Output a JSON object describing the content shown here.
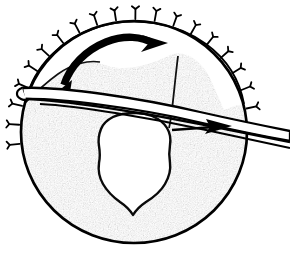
{
  "figure": {
    "description": "Line drawing of a circular cross-section with stippled shading, a central shield-shaped cavity, radiating suture tick marks around the rim, a curved sweeping arrow at the top and a straight arrow at the right, with a long tapered instrument passing diagonally across the section.",
    "background_color": "#ffffff",
    "ink_color": "#000000",
    "stipple_color": "#b2b2b2",
    "stipple_dark": "#8c8c8c",
    "cavity_fill": "#ffffff"
  },
  "geometry": {
    "canvas": {
      "width": 290,
      "height": 257
    },
    "outer_circle": {
      "label": "outer boundary",
      "center_x": 134,
      "center_y": 132,
      "radius_x": 114,
      "radius_y": 112,
      "stroke_width": 2.6
    },
    "inner_arc": {
      "label": "inner concentric rim arc",
      "center_x": 134,
      "center_y": 134,
      "radius_x": 106,
      "radius_y": 104,
      "stroke_width": 1.8
    }
  },
  "elements": {
    "rim_ticks": {
      "name": "radiating suture tick marks",
      "count": 19,
      "angle_start_deg": 186,
      "angle_end_deg": 12,
      "length": 11,
      "barb_length": 5,
      "stroke_width": 1.7,
      "note": "Small Y-shaped barbed marks projecting outward from the upper rim of the circle"
    },
    "shaded_region": {
      "name": "stippled tissue mass",
      "fill": "#b2b2b2",
      "texture": "fine random stipple"
    },
    "cavity": {
      "name": "central shield-shaped cavity",
      "fill": "#ffffff",
      "outline_width": 2.4,
      "top_y": 112,
      "bottom_y": 214,
      "left_x": 98,
      "right_x": 175
    },
    "curved_arrow": {
      "name": "rotation arrow",
      "direction": "left to right, sweeping clockwise over the top",
      "start_x": 64,
      "start_y": 84,
      "end_x": 154,
      "end_y": 46,
      "stroke_width": 7,
      "head_length": 18
    },
    "straight_arrow": {
      "name": "advance arrow",
      "direction": "pointing right",
      "start_x": 186,
      "start_y": 128,
      "end_x": 230,
      "end_y": 126,
      "stroke_width": 2.2,
      "head_length": 13
    },
    "instrument": {
      "name": "tapered instrument shaft",
      "description": "Long white band with black outlines running from the left rim down across to the right beyond the circle edge",
      "left_x": 20,
      "left_y": 88,
      "right_x": 290,
      "right_y": 128,
      "stroke_width": 2.4
    }
  },
  "labels": {
    "figure_alt": "Anatomical cross-section with instrument and directional arrows"
  }
}
